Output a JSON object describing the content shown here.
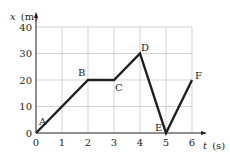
{
  "chart_data": {
    "type": "line",
    "title": "",
    "xlabel": "t (s)",
    "ylabel": "x (m)",
    "xlabel_var": "t",
    "xlabel_unit": "(s)",
    "ylabel_var": "x",
    "ylabel_unit": "(m)",
    "xlim": [
      0,
      6
    ],
    "ylim": [
      0,
      40
    ],
    "grid": true,
    "x_ticks": [
      "0",
      "1",
      "2",
      "3",
      "4",
      "5",
      "6"
    ],
    "y_ticks": [
      "0",
      "10",
      "20",
      "30",
      "40"
    ],
    "x_tick_values": [
      0,
      1,
      2,
      3,
      4,
      5,
      6
    ],
    "y_tick_values": [
      0,
      10,
      20,
      30,
      40
    ],
    "series": [
      {
        "name": "position",
        "x": [
          0,
          2,
          3,
          4,
          5,
          6
        ],
        "y": [
          0,
          20,
          20,
          30,
          0,
          20
        ]
      }
    ],
    "points": [
      {
        "label": "A",
        "x": 0,
        "y": 0
      },
      {
        "label": "B",
        "x": 2,
        "y": 20
      },
      {
        "label": "C",
        "x": 3,
        "y": 20
      },
      {
        "label": "D",
        "x": 4,
        "y": 30
      },
      {
        "label": "E",
        "x": 5,
        "y": 0
      },
      {
        "label": "F",
        "x": 6,
        "y": 20
      }
    ]
  },
  "colors": {
    "line": "#231f20",
    "grid": "#c8c8c8",
    "axis": "#231f20",
    "text": "#231f20"
  }
}
